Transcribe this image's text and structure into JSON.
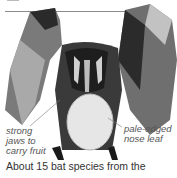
{
  "illustration": {
    "subject": "fruit bat with wings spread holding pale fruit",
    "annotations": [
      {
        "lines": [
          "strong",
          "jaws to",
          "carry fruit"
        ]
      },
      {
        "lines": [
          "pale-edged",
          "nose leaf"
        ]
      }
    ]
  },
  "caption": "About 15 bat species from the",
  "colors": {
    "background": "#ffffff",
    "bat_dark": "#1a1a1a",
    "bat_mid": "#6b6b6b",
    "fruit": "#e6e6e6"
  }
}
